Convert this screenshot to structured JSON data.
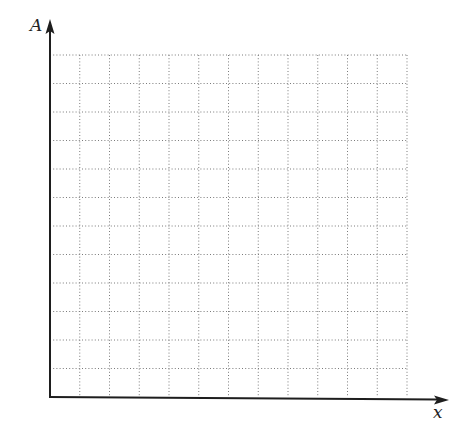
{
  "diagram": {
    "type": "blank-grid-graph",
    "y_axis_label": "A",
    "x_axis_label": "x",
    "grid": {
      "columns": 12,
      "rows": 12,
      "line_style": "dotted",
      "line_color": "#7a7a7a"
    },
    "axis_color": "#1e1e1e",
    "background": "#ffffff"
  }
}
